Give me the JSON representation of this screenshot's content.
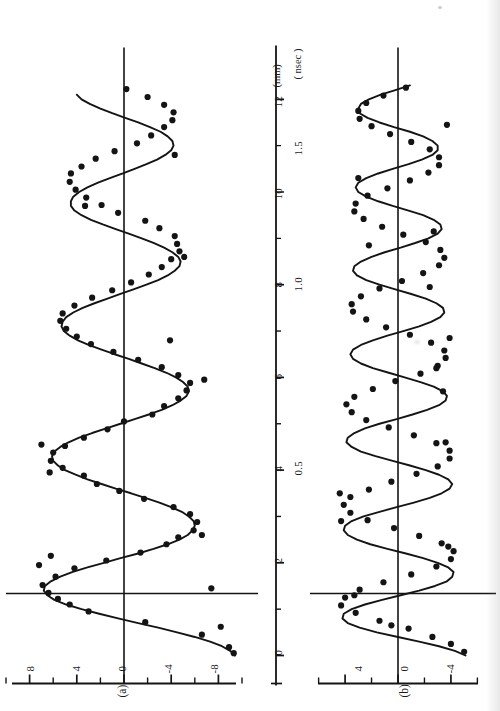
{
  "figure": {
    "orientation": "rotated-90-ccw",
    "background": "#ffffff",
    "ink": "#141414",
    "panels": [
      {
        "tag": "(a)",
        "y_ticks": [
          8,
          4,
          0,
          -4,
          -8
        ],
        "y_tick_labels": [
          "8",
          "4",
          "0",
          "-4",
          "-8"
        ],
        "y_minor_per_major": 1,
        "ylim": [
          -10,
          10
        ]
      },
      {
        "tag": "(b)",
        "y_ticks": [
          4,
          0,
          -4
        ],
        "y_tick_labels": [
          "4",
          "0",
          "-4"
        ],
        "y_minor_per_major": 1,
        "ylim": [
          -6.5,
          6.5
        ]
      }
    ],
    "x_axis": {
      "major_tick_labels": [
        "0",
        "2",
        "4",
        "6",
        "8",
        "10",
        "12"
      ],
      "major_tick_values": [
        0,
        2,
        4,
        6,
        8,
        10,
        12
      ],
      "minor_tick_values": [
        1,
        3,
        5,
        7,
        9,
        11
      ],
      "unit_top": "(mm)",
      "unit_bottom": "( nsec )",
      "secondary_labels": [
        "0.5",
        "1.0",
        "1.5"
      ],
      "secondary_values": [
        4.0,
        8.0,
        12.0
      ],
      "xlim": [
        0,
        12.6
      ]
    }
  },
  "chart_data": [
    {
      "type": "scatter",
      "title": "(a)",
      "xlabel": "(mm)",
      "ylabel": "",
      "xlim": [
        0,
        12.6
      ],
      "ylim": [
        -10,
        10
      ],
      "grid": false,
      "legend": "none",
      "annotations": [
        "(a)",
        "12 (mm)",
        "( nsec )",
        "0.5",
        "1.0",
        "1.5"
      ],
      "series": [
        {
          "name": "fitted-curve-a",
          "kind": "line",
          "x": [
            0.0,
            0.1,
            0.2,
            0.3,
            0.4,
            0.5,
            0.6,
            0.7,
            0.8,
            0.9,
            1.0,
            1.1,
            1.2,
            1.3,
            1.4,
            1.5,
            1.6,
            1.7,
            1.8,
            1.9,
            2.0,
            2.1,
            2.2,
            2.3,
            2.4,
            2.5,
            2.6,
            2.7,
            2.8,
            2.9,
            3.0,
            3.1,
            3.2,
            3.3,
            3.4,
            3.5,
            3.6,
            3.7,
            3.8,
            3.9,
            4.0,
            4.1,
            4.2,
            4.3,
            4.4,
            4.5,
            4.6,
            4.7,
            4.8,
            4.9,
            5.0,
            5.1,
            5.2,
            5.3,
            5.4,
            5.5,
            5.6,
            5.7,
            5.8,
            5.9,
            6.0,
            6.1,
            6.2,
            6.3,
            6.4,
            6.5,
            6.6,
            6.7,
            6.8,
            6.9,
            7.0,
            7.1,
            7.2,
            7.3,
            7.4,
            7.5,
            7.6,
            7.7,
            7.8,
            7.9,
            8.0,
            8.1,
            8.2,
            8.3,
            8.4,
            8.5,
            8.6,
            8.7,
            8.8,
            8.9,
            9.0,
            9.1,
            9.2,
            9.3,
            9.4,
            9.5,
            9.6,
            9.7,
            9.8,
            9.9,
            10.0,
            10.1,
            10.2,
            10.3,
            10.4,
            10.5,
            10.6,
            10.7,
            10.8,
            10.9,
            11.0,
            11.1,
            11.2,
            11.3,
            11.4,
            11.5,
            11.6,
            11.7,
            11.8,
            11.9,
            12.0,
            12.1,
            12.2,
            12.3,
            12.4
          ],
          "y": [
            -9.4,
            -9.0,
            -8.3,
            -7.3,
            -6.0,
            -4.5,
            -2.9,
            -1.2,
            0.5,
            2.1,
            3.6,
            4.9,
            5.9,
            6.5,
            6.8,
            6.7,
            6.2,
            5.4,
            4.4,
            3.1,
            1.7,
            0.3,
            -1.2,
            -2.5,
            -3.7,
            -4.7,
            -5.4,
            -5.8,
            -6.0,
            -5.9,
            -5.5,
            -4.9,
            -4.0,
            -3.0,
            -1.8,
            -0.6,
            0.7,
            1.9,
            3.1,
            4.1,
            5.0,
            5.6,
            6.0,
            6.1,
            5.9,
            5.4,
            4.7,
            3.8,
            2.7,
            1.5,
            0.3,
            -0.9,
            -2.1,
            -3.2,
            -4.1,
            -4.8,
            -5.3,
            -5.5,
            -5.4,
            -5.0,
            -4.4,
            -3.6,
            -2.6,
            -1.5,
            -0.4,
            0.8,
            1.9,
            3.0,
            3.9,
            4.6,
            5.1,
            5.3,
            5.2,
            4.9,
            4.3,
            3.5,
            2.5,
            1.4,
            0.3,
            -0.8,
            -1.9,
            -2.9,
            -3.7,
            -4.3,
            -4.7,
            -4.8,
            -4.6,
            -4.1,
            -3.4,
            -2.5,
            -1.5,
            -0.4,
            0.7,
            1.8,
            2.8,
            3.6,
            4.2,
            4.5,
            4.5,
            4.3,
            3.8,
            3.1,
            2.2,
            1.2,
            0.1,
            -0.9,
            -1.9,
            -2.8,
            -3.5,
            -4.0,
            -4.2,
            -4.1,
            -3.7,
            -3.1,
            -2.2,
            -1.2,
            -0.1,
            1.0,
            2.0,
            2.9,
            3.6,
            4.0
          ]
        },
        {
          "name": "data-points-a",
          "kind": "points",
          "x": [
            0.05,
            0.18,
            0.45,
            0.72,
            0.95,
            1.1,
            1.22,
            1.35,
            1.52,
            1.7,
            1.88,
            2.05,
            2.22,
            2.4,
            2.55,
            2.7,
            2.88,
            3.05,
            3.2,
            3.38,
            3.55,
            3.7,
            3.88,
            4.05,
            4.2,
            4.38,
            4.52,
            4.7,
            4.88,
            5.05,
            5.2,
            5.38,
            5.55,
            5.72,
            5.88,
            6.05,
            6.22,
            6.38,
            6.55,
            6.72,
            6.88,
            7.05,
            7.22,
            7.38,
            7.55,
            7.72,
            7.88,
            8.05,
            8.22,
            8.38,
            8.55,
            8.72,
            8.88,
            9.05,
            9.22,
            9.38,
            9.55,
            9.72,
            9.88,
            10.05,
            10.22,
            10.4,
            10.55,
            10.72,
            10.88,
            11.05,
            11.22,
            11.4,
            11.55,
            11.72,
            11.88,
            12.05,
            12.22,
            1.95,
            2.15,
            4.55,
            5.95,
            8.6,
            9.7,
            10.8,
            2.6,
            6.8,
            3.95,
            0.62,
            1.45
          ],
          "y": [
            -9.3,
            -8.9,
            -6.6,
            -1.8,
            3.0,
            4.6,
            5.6,
            6.4,
            6.9,
            5.8,
            4.2,
            1.5,
            -1.4,
            -3.6,
            -4.6,
            -5.9,
            -6.2,
            -5.6,
            -4.2,
            -1.7,
            0.4,
            2.3,
            3.4,
            5.2,
            6.2,
            6.0,
            5.0,
            3.4,
            1.4,
            0.0,
            -2.4,
            -3.4,
            -4.6,
            -5.3,
            -5.6,
            -4.6,
            -3.2,
            -1.2,
            0.9,
            2.8,
            4.0,
            4.9,
            5.4,
            5.2,
            4.2,
            2.7,
            1.0,
            -0.6,
            -2.1,
            -3.2,
            -4.0,
            -4.7,
            -4.5,
            -4.3,
            -3.0,
            -1.8,
            0.5,
            1.9,
            3.2,
            4.1,
            4.6,
            4.5,
            3.6,
            2.4,
            0.8,
            -1.1,
            -2.3,
            -3.4,
            -4.1,
            -4.2,
            -3.4,
            -2.0,
            -0.2,
            7.2,
            6.2,
            7.0,
            -6.8,
            -5.1,
            3.3,
            -4.3,
            -6.6,
            -3.9,
            6.3,
            -8.2,
            -7.4
          ]
        }
      ]
    },
    {
      "type": "scatter",
      "title": "(b)",
      "xlabel": "( nsec )",
      "ylabel": "",
      "xlim": [
        0,
        12.6
      ],
      "ylim": [
        -6.5,
        6.5
      ],
      "grid": false,
      "legend": "none",
      "annotations": [
        "(b)"
      ],
      "series": [
        {
          "name": "fitted-curve-b",
          "kind": "line",
          "x": [
            0.0,
            0.1,
            0.2,
            0.3,
            0.4,
            0.5,
            0.6,
            0.7,
            0.8,
            0.9,
            1.0,
            1.1,
            1.2,
            1.3,
            1.4,
            1.5,
            1.6,
            1.7,
            1.8,
            1.9,
            2.0,
            2.1,
            2.2,
            2.3,
            2.4,
            2.5,
            2.6,
            2.7,
            2.8,
            2.9,
            3.0,
            3.1,
            3.2,
            3.3,
            3.4,
            3.5,
            3.6,
            3.7,
            3.8,
            3.9,
            4.0,
            4.1,
            4.2,
            4.3,
            4.4,
            4.5,
            4.6,
            4.7,
            4.8,
            4.9,
            5.0,
            5.1,
            5.2,
            5.3,
            5.4,
            5.5,
            5.6,
            5.7,
            5.8,
            5.9,
            6.0,
            6.1,
            6.2,
            6.3,
            6.4,
            6.5,
            6.6,
            6.7,
            6.8,
            6.9,
            7.0,
            7.1,
            7.2,
            7.3,
            7.4,
            7.5,
            7.6,
            7.7,
            7.8,
            7.9,
            8.0,
            8.1,
            8.2,
            8.3,
            8.4,
            8.5,
            8.6,
            8.7,
            8.8,
            8.9,
            9.0,
            9.1,
            9.2,
            9.3,
            9.4,
            9.5,
            9.6,
            9.7,
            9.8,
            9.9,
            10.0,
            10.1,
            10.2,
            10.3,
            10.4,
            10.5,
            10.6,
            10.7,
            10.8,
            10.9,
            11.0,
            11.1,
            11.2,
            11.3,
            11.4,
            11.5,
            11.6,
            11.7,
            11.8,
            11.9,
            12.0,
            12.1,
            12.2,
            12.3,
            12.4
          ],
          "y": [
            -5.1,
            -4.3,
            -3.1,
            -1.6,
            0.0,
            1.6,
            2.9,
            3.8,
            4.2,
            4.1,
            3.5,
            2.5,
            1.2,
            -0.2,
            -1.6,
            -2.8,
            -3.7,
            -4.1,
            -4.2,
            -3.8,
            -3.0,
            -1.9,
            -0.6,
            0.8,
            2.1,
            3.1,
            3.8,
            4.1,
            4.0,
            3.5,
            2.6,
            1.4,
            0.1,
            -1.2,
            -2.4,
            -3.3,
            -3.9,
            -4.1,
            -3.8,
            -3.1,
            -2.1,
            -0.9,
            0.4,
            1.7,
            2.8,
            3.5,
            3.9,
            3.8,
            3.3,
            2.5,
            1.4,
            0.1,
            -1.1,
            -2.2,
            -3.1,
            -3.6,
            -3.7,
            -3.4,
            -2.7,
            -1.7,
            -0.5,
            0.7,
            1.9,
            2.8,
            3.4,
            3.6,
            3.4,
            2.8,
            1.9,
            0.8,
            -0.4,
            -1.6,
            -2.5,
            -3.2,
            -3.5,
            -3.4,
            -2.9,
            -2.1,
            -1.0,
            0.2,
            1.4,
            2.4,
            3.1,
            3.4,
            3.3,
            2.8,
            2.0,
            1.0,
            -0.2,
            -1.3,
            -2.3,
            -3.0,
            -3.3,
            -3.2,
            -2.7,
            -1.9,
            -0.8,
            0.4,
            1.5,
            2.4,
            3.0,
            3.2,
            3.0,
            2.4,
            1.5,
            0.4,
            -0.8,
            -1.8,
            -2.6,
            -3.0,
            -3.0,
            -2.6,
            -1.9,
            -0.9,
            0.3,
            1.4,
            2.3,
            2.9,
            3.0,
            2.8,
            2.2,
            1.3,
            0.2,
            -0.9
          ]
        },
        {
          "name": "data-points-b",
          "kind": "points",
          "x": [
            0.08,
            0.25,
            0.4,
            0.58,
            0.75,
            0.92,
            1.08,
            1.25,
            1.42,
            1.58,
            1.75,
            1.92,
            2.08,
            2.25,
            2.42,
            2.58,
            2.75,
            2.92,
            3.08,
            3.25,
            3.42,
            3.58,
            3.75,
            3.92,
            4.08,
            4.25,
            4.42,
            4.58,
            4.75,
            4.92,
            5.08,
            5.25,
            5.42,
            5.58,
            5.75,
            5.92,
            6.08,
            6.25,
            6.42,
            6.58,
            6.75,
            6.92,
            7.08,
            7.25,
            7.42,
            7.58,
            7.75,
            7.92,
            8.08,
            8.25,
            8.42,
            8.58,
            8.75,
            8.92,
            9.08,
            9.25,
            9.42,
            9.58,
            9.75,
            9.92,
            10.08,
            10.25,
            10.42,
            10.58,
            10.75,
            10.92,
            11.08,
            11.25,
            11.42,
            11.58,
            11.75,
            11.92,
            12.08,
            12.25,
            0.65,
            1.3,
            2.35,
            3.5,
            4.6,
            5.7,
            6.85,
            7.95,
            9.15,
            10.3,
            11.45,
            2.9,
            6.2,
            8.85
          ],
          "y": [
            -5.0,
            -4.0,
            -2.6,
            -0.8,
            1.4,
            3.2,
            4.3,
            4.0,
            2.9,
            1.1,
            -1.0,
            -2.9,
            -4.0,
            -4.2,
            -3.3,
            -1.6,
            0.3,
            2.3,
            3.6,
            4.1,
            3.6,
            2.2,
            0.5,
            -1.4,
            -3.0,
            -3.9,
            -3.9,
            -2.9,
            -1.2,
            0.7,
            2.4,
            3.5,
            3.9,
            3.3,
            1.9,
            0.2,
            -1.7,
            -3.0,
            -3.6,
            -3.5,
            -2.5,
            -0.9,
            0.9,
            2.4,
            3.4,
            3.5,
            2.8,
            1.4,
            -0.3,
            -1.9,
            -3.1,
            -3.5,
            -3.2,
            -2.1,
            -0.4,
            1.2,
            2.6,
            3.3,
            3.2,
            2.3,
            0.8,
            -0.9,
            -2.3,
            -3.1,
            -3.1,
            -2.4,
            -1.0,
            0.6,
            2.0,
            2.9,
            3.0,
            2.4,
            1.1,
            -0.6,
            0.5,
            3.3,
            -3.8,
            4.4,
            -3.6,
            -3.4,
            -3.9,
            -2.4,
            -2.7,
            3.0,
            -3.7,
            4.3,
            -2.9,
            2.2
          ]
        }
      ]
    }
  ]
}
